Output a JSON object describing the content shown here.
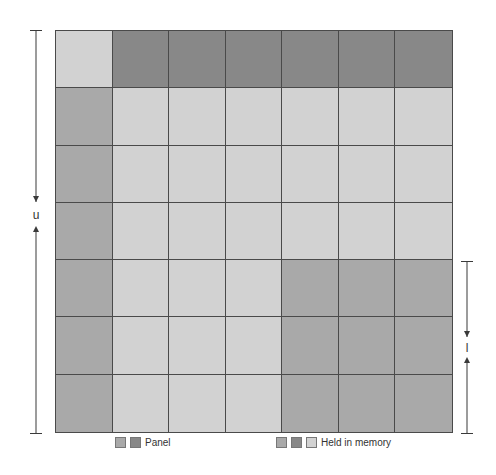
{
  "diagram": {
    "rows": 7,
    "cols": 7,
    "colors": {
      "light": "#d2d2d2",
      "medium": "#a9a9a9",
      "dark": "#888888"
    },
    "cells": [
      [
        "light",
        "dark",
        "dark",
        "dark",
        "dark",
        "dark",
        "dark"
      ],
      [
        "medium",
        "light",
        "light",
        "light",
        "light",
        "light",
        "light"
      ],
      [
        "medium",
        "light",
        "light",
        "light",
        "light",
        "light",
        "light"
      ],
      [
        "medium",
        "light",
        "light",
        "light",
        "light",
        "light",
        "light"
      ],
      [
        "medium",
        "light",
        "light",
        "light",
        "medium",
        "medium",
        "medium"
      ],
      [
        "medium",
        "light",
        "light",
        "light",
        "medium",
        "medium",
        "medium"
      ],
      [
        "medium",
        "light",
        "light",
        "light",
        "medium",
        "medium",
        "medium"
      ]
    ],
    "left_bracket": {
      "label": "u"
    },
    "right_bracket": {
      "label": "l"
    }
  },
  "legend": {
    "panel": {
      "label": "Panel",
      "swatches": [
        "medium",
        "dark"
      ]
    },
    "memory": {
      "label": "Held in memory",
      "swatches": [
        "medium",
        "dark",
        "light"
      ]
    }
  }
}
